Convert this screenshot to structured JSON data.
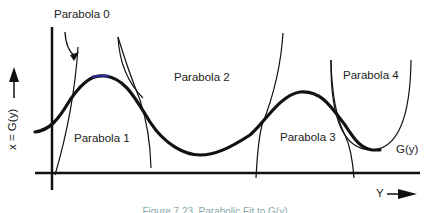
{
  "diagram": {
    "labels": {
      "parabola0": "Parabola 0",
      "parabola1": "Parabola 1",
      "parabola2": "Parabola 2",
      "parabola3": "Parabola 3",
      "parabola4": "Parabola 4",
      "curve": "G(y)"
    },
    "axes": {
      "y_axis_label": "x = G(y)",
      "x_axis_label": "Y"
    },
    "caption": "Figure 7.23. Parabolic Fit to G(y)",
    "colors": {
      "stroke": "#111111",
      "curve_highlight": "#2a2a8a"
    }
  }
}
